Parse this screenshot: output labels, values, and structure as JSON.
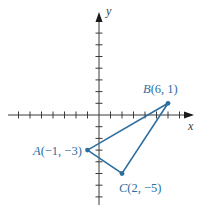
{
  "diagram": {
    "type": "coordinate-plane-triangle",
    "axes": {
      "x_label": "x",
      "y_label": "y",
      "x_ticks": [
        -7,
        -6,
        -5,
        -4,
        -3,
        -2,
        -1,
        1,
        2,
        3,
        4,
        5,
        6,
        7
      ],
      "y_ticks": [
        -7,
        -6,
        -5,
        -4,
        -3,
        -2,
        -1,
        1,
        2,
        3,
        4,
        5,
        6,
        7
      ]
    },
    "points": [
      {
        "letter": "A",
        "coords": "(−1, −3)",
        "x": -1,
        "y": -3
      },
      {
        "letter": "B",
        "coords": "(6, 1)",
        "x": 6,
        "y": 1
      },
      {
        "letter": "C",
        "coords": "(2, −5)",
        "x": 2,
        "y": -5
      }
    ],
    "colors": {
      "triangle": "#2e6e9e",
      "axes": "#3a3a3a"
    }
  }
}
